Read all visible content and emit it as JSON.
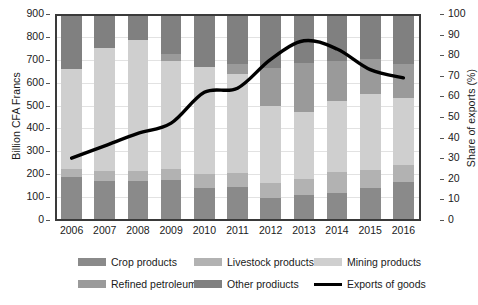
{
  "chart_data": {
    "type": "bar",
    "title": "",
    "xlabel": "",
    "ylabel": "Billion CFA Francs",
    "y2label": "Share of exports (%)",
    "ylim": [
      0,
      900
    ],
    "y2lim": [
      0,
      100
    ],
    "grid": true,
    "stacked": true,
    "legend_position": "bottom",
    "categories": [
      "2006",
      "2007",
      "2008",
      "2009",
      "2010",
      "2011",
      "2012",
      "2013",
      "2014",
      "2015",
      "2016"
    ],
    "yticks": [
      "900",
      "800",
      "700",
      "600",
      "500",
      "400",
      "300",
      "200",
      "100",
      "0"
    ],
    "ytick_values": [
      900,
      800,
      700,
      600,
      500,
      400,
      300,
      200,
      100,
      0
    ],
    "y2ticks": [
      "100",
      "90",
      "80",
      "70",
      "60",
      "50",
      "40",
      "30",
      "20",
      "10",
      "0"
    ],
    "y2tick_values": [
      100,
      90,
      80,
      70,
      60,
      50,
      40,
      30,
      20,
      10,
      0
    ],
    "series": [
      {
        "name": "Crop products",
        "color": "#8a8a8a",
        "values": [
          190,
          170,
          170,
          175,
          140,
          145,
          95,
          110,
          120,
          140,
          165
        ]
      },
      {
        "name": "Livestock products",
        "color": "#b2b2b2",
        "values": [
          35,
          45,
          45,
          50,
          60,
          60,
          65,
          70,
          90,
          80,
          75
        ]
      },
      {
        "name": "Mining products",
        "color": "#cfcfcf",
        "values": [
          435,
          535,
          570,
          470,
          470,
          435,
          340,
          290,
          310,
          330,
          295
        ]
      },
      {
        "name": "Refined petroleum",
        "color": "#9a9a9a",
        "values": [
          0,
          0,
          0,
          30,
          0,
          40,
          165,
          215,
          175,
          155,
          145
        ]
      },
      {
        "name": "Other products",
        "color": "#808080",
        "values": [
          240,
          150,
          115,
          175,
          230,
          220,
          235,
          215,
          205,
          195,
          220
        ]
      }
    ],
    "line_series": {
      "name": "Exports of goods",
      "color": "#000000",
      "axis": "right",
      "values": [
        30,
        36,
        42,
        47,
        62,
        64,
        78,
        87,
        83,
        73,
        69
      ]
    }
  },
  "legend": {
    "items": [
      {
        "label": "Crop products",
        "swatch": "#8a8a8a",
        "kind": "swatch"
      },
      {
        "label": "Livestock products",
        "swatch": "#b2b2b2",
        "kind": "swatch"
      },
      {
        "label": "Mining products",
        "swatch": "#cfcfcf",
        "kind": "swatch"
      },
      {
        "label": "Refined petroleum",
        "swatch": "#9a9a9a",
        "kind": "swatch"
      },
      {
        "label": "Other prodiucts",
        "swatch": "#808080",
        "kind": "swatch"
      },
      {
        "label": "Exports of goods",
        "swatch": "#000000",
        "kind": "line"
      }
    ]
  }
}
